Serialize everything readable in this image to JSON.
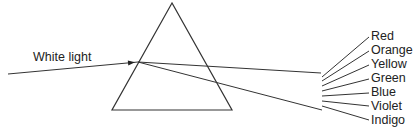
{
  "diagram": {
    "incident_label": "White light",
    "prism": {
      "apex": [
        172,
        3
      ],
      "base_left": [
        112,
        110
      ],
      "base_right": [
        232,
        110
      ]
    },
    "incident_ray": {
      "from": [
        8,
        74
      ],
      "to": [
        138,
        62
      ]
    },
    "refracted_rays": [
      {
        "from": [
          138,
          62
        ],
        "to": [
          321,
          73
        ]
      },
      {
        "from": [
          138,
          62
        ],
        "to": [
          322,
          110
        ]
      }
    ],
    "spectrum": [
      {
        "label": "Red",
        "from": [
          322,
          77
        ],
        "to": [
          369,
          37
        ]
      },
      {
        "label": "Orange",
        "from": [
          322,
          81
        ],
        "to": [
          369,
          51
        ]
      },
      {
        "label": "Yellow",
        "from": [
          322,
          86
        ],
        "to": [
          369,
          65
        ]
      },
      {
        "label": "Green",
        "from": [
          322,
          91
        ],
        "to": [
          369,
          79
        ]
      },
      {
        "label": "Blue",
        "from": [
          322,
          96
        ],
        "to": [
          369,
          93
        ]
      },
      {
        "label": "Violet",
        "from": [
          322,
          101
        ],
        "to": [
          369,
          106
        ]
      },
      {
        "label": "Indigo",
        "from": [
          322,
          106
        ],
        "to": [
          369,
          120
        ]
      }
    ],
    "colors": {
      "line": "#333333",
      "text": "#222222",
      "background": "#ffffff"
    }
  }
}
